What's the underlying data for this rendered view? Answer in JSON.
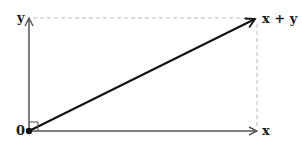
{
  "diagram": {
    "labels": {
      "origin": "0",
      "y_vector": "y",
      "x_vector": "x",
      "sum_vector": "x + y"
    },
    "colors": {
      "axis": "#555555",
      "sum": "#111111",
      "dashed": "#bbbbbb",
      "text": "#1a1a1a"
    },
    "right_angle_marker": true
  }
}
